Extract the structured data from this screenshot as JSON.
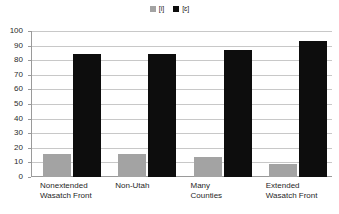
{
  "chart_data": {
    "type": "bar",
    "title": "",
    "subtitle": "",
    "xlabel": "",
    "ylabel": "",
    "ylim": [
      0,
      100
    ],
    "ytick_step": 10,
    "yticks": [
      100,
      90,
      80,
      70,
      60,
      50,
      40,
      30,
      20,
      10,
      0
    ],
    "grid": true,
    "legend_position": "top-center",
    "categories": [
      "Nonextended Wasatch Front",
      "Non-Utah",
      "Many Counties",
      "Extended Wasatch Front"
    ],
    "category_lines": [
      [
        "Nonextended",
        "Wasatch Front"
      ],
      [
        "Non-Utah",
        ""
      ],
      [
        "Many",
        "Counties"
      ],
      [
        "Extended",
        "Wasatch Front"
      ]
    ],
    "series": [
      {
        "name": "[i]",
        "color": "#a3a3a3",
        "values": [
          16,
          16,
          14,
          9
        ]
      },
      {
        "name": "[ɛ]",
        "color": "#0d0d0d",
        "values": [
          84,
          84,
          87,
          93
        ]
      }
    ]
  },
  "legend": {
    "items": [
      {
        "label": "[i]",
        "color": "#a3a3a3"
      },
      {
        "label": "[ɛ]",
        "color": "#0d0d0d"
      }
    ]
  },
  "colors": {
    "gray_series": "#a3a3a3",
    "black_series": "#0d0d0d",
    "gridline": "#c8c8c8",
    "axis": "#9a9a9a",
    "background": "#ffffff",
    "text": "#1f1f1f"
  }
}
